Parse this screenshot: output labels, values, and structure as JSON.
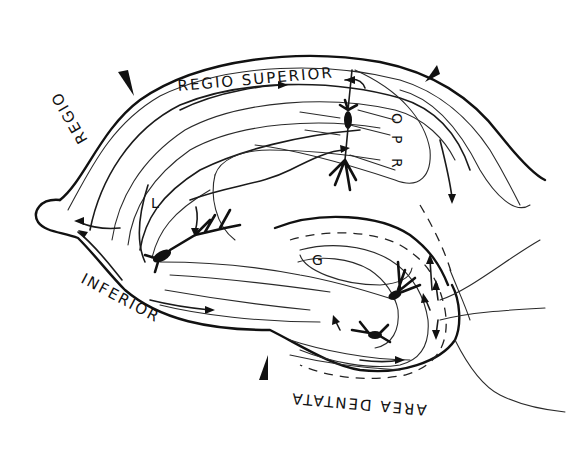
{
  "diagram": {
    "regions": {
      "regio_superior": "REGIO SUPERIOR",
      "regio": "REGIO",
      "inferior": "INFERIOR",
      "area_dentata": "AREA DENTATA"
    },
    "layer_labels": {
      "o": "O",
      "p": "P",
      "r": "R",
      "l": "L",
      "g": "G"
    },
    "markers": [
      {
        "name": "boundary-marker-left",
        "position": "between REGIO and REGIO SUPERIOR"
      },
      {
        "name": "boundary-marker-right",
        "position": "end of REGIO SUPERIOR"
      },
      {
        "name": "boundary-marker-bottom",
        "position": "between INFERIOR and AREA DENTATA"
      }
    ],
    "colors": {
      "line": "#111111",
      "background": "#ffffff"
    }
  }
}
